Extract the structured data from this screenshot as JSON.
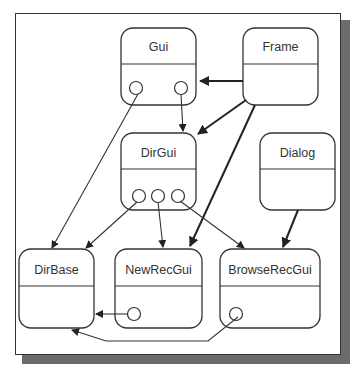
{
  "diagram": {
    "type": "class-relationship",
    "nodes": [
      {
        "id": "gui",
        "label": "Gui"
      },
      {
        "id": "frame",
        "label": "Frame"
      },
      {
        "id": "dirgui",
        "label": "DirGui"
      },
      {
        "id": "dialog",
        "label": "Dialog"
      },
      {
        "id": "dirbase",
        "label": "DirBase"
      },
      {
        "id": "newrecgui",
        "label": "NewRecGui"
      },
      {
        "id": "browserecgui",
        "label": "BrowseRecGui"
      }
    ],
    "edges": [
      {
        "from": "frame",
        "to": "gui",
        "style": "bold"
      },
      {
        "from": "frame",
        "to": "dirgui",
        "style": "bold"
      },
      {
        "from": "frame",
        "to": "newrecgui",
        "style": "bold"
      },
      {
        "from": "dialog",
        "to": "browserecgui",
        "style": "bold"
      },
      {
        "from": "gui",
        "to": "dirbase",
        "style": "thin",
        "port": true
      },
      {
        "from": "gui",
        "to": "dirgui",
        "style": "thin",
        "port": true
      },
      {
        "from": "dirgui",
        "to": "dirbase",
        "style": "thin",
        "port": true
      },
      {
        "from": "dirgui",
        "to": "newrecgui",
        "style": "thin",
        "port": true
      },
      {
        "from": "dirgui",
        "to": "browserecgui",
        "style": "thin",
        "port": true
      },
      {
        "from": "newrecgui",
        "to": "dirbase",
        "style": "thin",
        "port": true
      },
      {
        "from": "browserecgui",
        "to": "dirbase",
        "style": "thin",
        "port": true
      }
    ]
  }
}
